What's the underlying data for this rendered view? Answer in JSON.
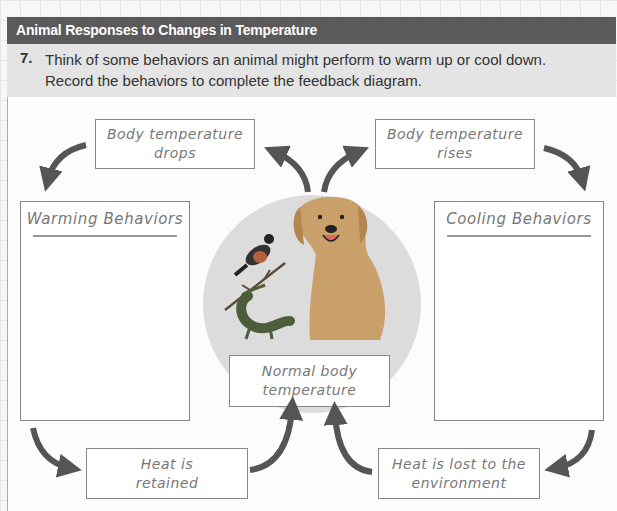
{
  "header": {
    "title": "Animal Responses to Changes in Temperature"
  },
  "question": {
    "number": "7.",
    "text": "Think of some behaviors an animal might perform to warm up or cool down. Record the behaviors to complete the feedback diagram."
  },
  "diagram": {
    "top_left": {
      "line1": "Body temperature",
      "line2": "drops"
    },
    "top_right": {
      "line1": "Body temperature",
      "line2": "rises"
    },
    "left_panel": {
      "title": "Warming Behaviors",
      "answer": ""
    },
    "right_panel": {
      "title": "Cooling Behaviors",
      "answer": ""
    },
    "center": {
      "line1": "Normal body",
      "line2": "temperature",
      "animals": [
        "bird-icon",
        "lizard-icon",
        "dog-icon"
      ]
    },
    "bottom_left": {
      "line1": "Heat is",
      "line2": "retained"
    },
    "bottom_right": {
      "line1": "Heat is lost to the",
      "line2": "environment"
    }
  },
  "colors": {
    "header_bg": "#5a5a5a",
    "prompt_bg": "#e4e4e4",
    "arrow": "#555555",
    "circle": "#dcdcdc"
  }
}
